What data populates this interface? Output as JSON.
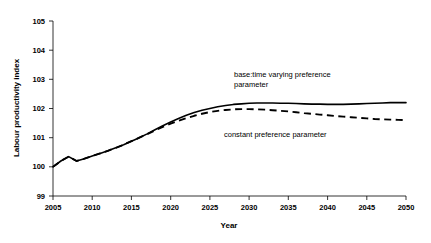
{
  "chart_data": {
    "type": "line",
    "title": "",
    "xlabel": "Year",
    "ylabel": "Labour productivity index",
    "xlim": [
      2005,
      2050
    ],
    "ylim": [
      99,
      105
    ],
    "grid": false,
    "legend_position": "inline-annotations",
    "xticks": [
      "2005",
      "2010",
      "2015",
      "2020",
      "2025",
      "2030",
      "2035",
      "2040",
      "2045",
      "2050"
    ],
    "yticks": [
      "99",
      "100",
      "101",
      "102",
      "103",
      "104",
      "105"
    ],
    "x": [
      2005,
      2006,
      2007,
      2008,
      2009,
      2010,
      2011,
      2012,
      2013,
      2014,
      2015,
      2016,
      2017,
      2018,
      2019,
      2020,
      2021,
      2022,
      2023,
      2024,
      2025,
      2026,
      2027,
      2028,
      2029,
      2030,
      2031,
      2032,
      2033,
      2034,
      2035,
      2036,
      2037,
      2038,
      2039,
      2040,
      2041,
      2042,
      2043,
      2044,
      2045,
      2046,
      2047,
      2048,
      2049,
      2050
    ],
    "series": [
      {
        "name": "base:time varying preference parameter",
        "style": "solid",
        "color": "#000000",
        "values": [
          100.0,
          100.2,
          100.35,
          100.2,
          100.28,
          100.37,
          100.46,
          100.55,
          100.65,
          100.76,
          100.88,
          101.0,
          101.13,
          101.27,
          101.41,
          101.54,
          101.66,
          101.77,
          101.86,
          101.94,
          102.0,
          102.06,
          102.1,
          102.14,
          102.16,
          102.18,
          102.19,
          102.19,
          102.19,
          102.18,
          102.18,
          102.17,
          102.16,
          102.15,
          102.15,
          102.14,
          102.14,
          102.14,
          102.15,
          102.16,
          102.17,
          102.18,
          102.19,
          102.2,
          102.2,
          102.2
        ]
      },
      {
        "name": "constant preference parameter",
        "style": "dashed",
        "color": "#000000",
        "values": [
          100.0,
          100.2,
          100.35,
          100.2,
          100.28,
          100.37,
          100.46,
          100.55,
          100.65,
          100.76,
          100.88,
          101.0,
          101.12,
          101.25,
          101.37,
          101.48,
          101.58,
          101.67,
          101.75,
          101.82,
          101.88,
          101.92,
          101.95,
          101.97,
          101.98,
          101.98,
          101.97,
          101.96,
          101.94,
          101.92,
          101.9,
          101.87,
          101.84,
          101.82,
          101.79,
          101.77,
          101.74,
          101.72,
          101.7,
          101.68,
          101.66,
          101.64,
          101.63,
          101.62,
          101.61,
          101.6
        ]
      }
    ],
    "annotations": [
      {
        "id": "annotation-base",
        "line1": "base:time varying preference",
        "line2": "parameter"
      },
      {
        "id": "annotation-constant",
        "line1": "constant preference parameter",
        "line2": ""
      }
    ]
  }
}
